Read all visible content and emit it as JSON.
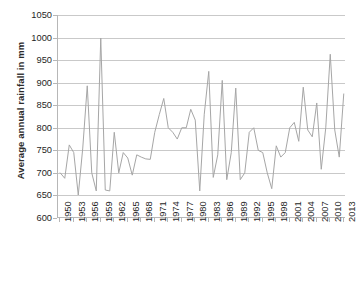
{
  "chart_data": {
    "type": "line",
    "title": "",
    "xlabel": "",
    "ylabel": "Average annual rainfall in mm",
    "ylim": [
      600,
      1050
    ],
    "ytick_values": [
      600,
      650,
      700,
      750,
      800,
      850,
      900,
      950,
      1000,
      1050
    ],
    "grid": true,
    "legend": "none",
    "line_color": "#A6A6A6",
    "x_tick_step": 3,
    "x_tick_labels": [
      "1950",
      "1953",
      "1956",
      "1959",
      "1962",
      "1965",
      "1968",
      "1971",
      "1974",
      "1977",
      "1980",
      "1983",
      "1986",
      "1989",
      "1992",
      "1995",
      "1998",
      "2001",
      "2004",
      "2007",
      "2010",
      "2013"
    ],
    "x": [
      1950,
      1951,
      1952,
      1953,
      1954,
      1955,
      1956,
      1957,
      1958,
      1959,
      1960,
      1961,
      1962,
      1963,
      1964,
      1965,
      1966,
      1967,
      1968,
      1969,
      1970,
      1971,
      1972,
      1973,
      1974,
      1975,
      1976,
      1977,
      1978,
      1979,
      1980,
      1981,
      1982,
      1983,
      1984,
      1985,
      1986,
      1987,
      1988,
      1989,
      1990,
      1991,
      1992,
      1993,
      1994,
      1995,
      1996,
      1997,
      1998,
      1999,
      2000,
      2001,
      2002,
      2003,
      2004,
      2005,
      2006,
      2007,
      2008,
      2009,
      2010,
      2011,
      2012,
      2013
    ],
    "values": [
      700,
      688,
      762,
      745,
      651,
      755,
      893,
      700,
      660,
      999,
      662,
      660,
      790,
      700,
      745,
      733,
      695,
      740,
      735,
      731,
      730,
      790,
      829,
      865,
      800,
      790,
      775,
      800,
      800,
      841,
      817,
      660,
      830,
      925,
      690,
      740,
      905,
      685,
      745,
      888,
      685,
      700,
      790,
      800,
      750,
      745,
      700,
      665,
      760,
      735,
      745,
      800,
      812,
      770,
      890,
      795,
      780,
      855,
      708,
      800,
      963,
      795,
      735,
      875
    ]
  }
}
